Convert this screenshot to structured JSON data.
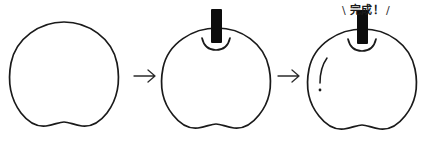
{
  "illustration": {
    "title": "apple-drawing-steps",
    "background_color": "#ffffff",
    "ink_color": "#1a1a1a",
    "stem_color": "#0d0d0d"
  },
  "steps": [
    {
      "index": "1",
      "name": "apple-body-outline",
      "description": "apple body outline only",
      "has_stem": "false",
      "has_shine": "false"
    },
    {
      "index": "2",
      "name": "apple-with-stem",
      "description": "apple body with stem and top dimple",
      "has_stem": "true",
      "has_shine": "false"
    },
    {
      "index": "3",
      "name": "apple-completed",
      "description": "apple body with stem, dimple and shine highlight",
      "has_stem": "true",
      "has_shine": "true"
    }
  ],
  "arrows": [
    {
      "name": "arrow-step1-to-step2",
      "glyph": "arrow-right-icon"
    },
    {
      "name": "arrow-step2-to-step3",
      "glyph": "arrow-right-icon"
    }
  ],
  "caption": {
    "slash_left": "\\",
    "text": "完成！",
    "slash_right": "/"
  }
}
